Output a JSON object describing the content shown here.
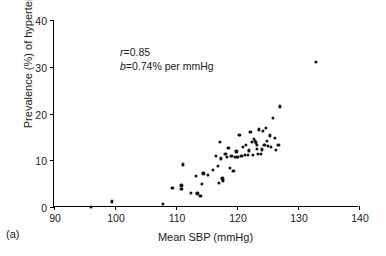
{
  "panel": {
    "label": "(a)"
  },
  "chart_data": {
    "type": "scatter",
    "title": "",
    "xlabel": "Mean SBP (mmHg)",
    "ylabel": "Prevalence (%) of hypertension",
    "xlim": [
      90,
      140
    ],
    "ylim": [
      0,
      40
    ],
    "xticks": [
      90,
      100,
      110,
      120,
      130,
      140
    ],
    "yticks": [
      0,
      10,
      20,
      30,
      40
    ],
    "grid": false,
    "legend": "none",
    "marker": "filled-circle",
    "marker_color": "#151515",
    "annotations": [
      {
        "symbol": "r",
        "text": "=0.85"
      },
      {
        "symbol": "b",
        "text": "=0.74% per mmHg"
      }
    ],
    "correlation_r": 0.85,
    "slope_b_percent_per_mmHg": 0.74,
    "n_points": 66,
    "points": [
      [
        96.0,
        0.1
      ],
      [
        99.5,
        1.2
      ],
      [
        107.8,
        0.6
      ],
      [
        109.4,
        4.0
      ],
      [
        110.9,
        4.6
      ],
      [
        110.9,
        3.9
      ],
      [
        111.1,
        9.1
      ],
      [
        112.4,
        3.1
      ],
      [
        113.2,
        6.6
      ],
      [
        113.5,
        2.9
      ],
      [
        114.0,
        2.4
      ],
      [
        114.2,
        5.0
      ],
      [
        114.5,
        7.2
      ],
      [
        115.2,
        6.9
      ],
      [
        116.0,
        7.9
      ],
      [
        116.6,
        10.9
      ],
      [
        116.9,
        8.8
      ],
      [
        117.0,
        5.1
      ],
      [
        117.2,
        13.9
      ],
      [
        117.4,
        10.4
      ],
      [
        117.6,
        6.1
      ],
      [
        117.7,
        5.7
      ],
      [
        118.1,
        11.3
      ],
      [
        118.4,
        10.7
      ],
      [
        118.6,
        12.7
      ],
      [
        118.8,
        8.3
      ],
      [
        119.0,
        11.0
      ],
      [
        119.2,
        10.9
      ],
      [
        119.4,
        7.7
      ],
      [
        119.6,
        10.8
      ],
      [
        119.9,
        11.9
      ],
      [
        120.0,
        10.8
      ],
      [
        120.2,
        10.8
      ],
      [
        120.4,
        15.5
      ],
      [
        120.6,
        11.0
      ],
      [
        120.8,
        10.9
      ],
      [
        121.0,
        12.8
      ],
      [
        121.3,
        11.1
      ],
      [
        121.5,
        13.3
      ],
      [
        121.8,
        11.2
      ],
      [
        122.0,
        12.1
      ],
      [
        122.2,
        16.1
      ],
      [
        122.4,
        13.9
      ],
      [
        122.6,
        11.2
      ],
      [
        122.8,
        14.6
      ],
      [
        123.0,
        14.2
      ],
      [
        123.1,
        13.8
      ],
      [
        123.2,
        13.2
      ],
      [
        123.3,
        12.4
      ],
      [
        123.4,
        11.4
      ],
      [
        123.6,
        16.6
      ],
      [
        123.9,
        11.3
      ],
      [
        124.1,
        12.3
      ],
      [
        124.3,
        16.2
      ],
      [
        124.5,
        13.2
      ],
      [
        124.7,
        17.0
      ],
      [
        124.9,
        14.2
      ],
      [
        125.1,
        13.1
      ],
      [
        125.4,
        15.3
      ],
      [
        125.6,
        12.9
      ],
      [
        125.9,
        19.1
      ],
      [
        126.2,
        14.8
      ],
      [
        126.4,
        12.2
      ],
      [
        127.0,
        21.5
      ],
      [
        126.8,
        13.3
      ],
      [
        132.9,
        31.0
      ]
    ]
  }
}
